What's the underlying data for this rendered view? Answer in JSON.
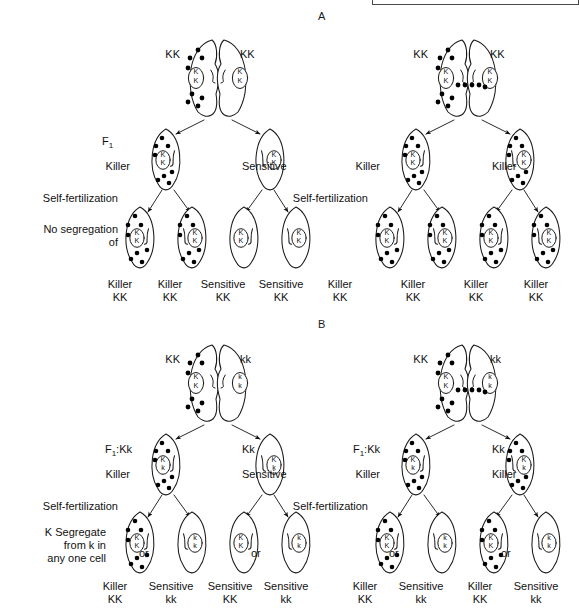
{
  "figure": {
    "title_letters": {
      "panel_a": "A",
      "panel_b": "B"
    },
    "colors": {
      "ink": "#111111",
      "cell_stroke": "#1a1a1a",
      "kappa": "#000000",
      "crop_border": "#4a4a4a"
    }
  },
  "panels": [
    {
      "id": "A",
      "letter": "A",
      "side_labels": [
        {
          "name": "f1",
          "text": "F",
          "sub": "1"
        },
        {
          "name": "killer",
          "text": "Killer"
        },
        {
          "name": "self-fertilization",
          "text": "Self-fertilization"
        },
        {
          "name": "no-segregation-1",
          "text": "No segregation"
        },
        {
          "name": "no-segregation-2",
          "text": "of"
        }
      ],
      "crosses": [
        {
          "id": "A-left",
          "parents": [
            {
              "genotype": "KK",
              "kappa": true,
              "nucleus": "KK"
            },
            {
              "genotype": "KK",
              "kappa": false,
              "nucleus": "KK"
            }
          ],
          "bridge_transfer": false,
          "f1": [
            {
              "phenotype": "Killer",
              "genotype_label": "",
              "kappa": true,
              "nucleus": "KK"
            },
            {
              "phenotype": "Sensitive",
              "genotype_label": "",
              "kappa": false,
              "nucleus": "KK"
            }
          ],
          "offspring": [
            {
              "phenotype": "Killer",
              "genotype": "KK",
              "kappa": true,
              "nucleus": "KK"
            },
            {
              "phenotype": "Killer",
              "genotype": "KK",
              "kappa": true,
              "nucleus": "KK"
            },
            {
              "phenotype": "Sensitive",
              "genotype": "KK",
              "kappa": false,
              "nucleus": "KK"
            },
            {
              "phenotype": "Sensitive",
              "genotype": "KK",
              "kappa": false,
              "nucleus": "KK"
            }
          ]
        },
        {
          "id": "A-right",
          "parents": [
            {
              "genotype": "KK",
              "kappa": true,
              "nucleus": "KK"
            },
            {
              "genotype": "KK",
              "kappa": false,
              "nucleus": "KK"
            }
          ],
          "bridge_transfer": true,
          "f1": [
            {
              "phenotype": "Killer",
              "genotype_label": "",
              "kappa": true,
              "nucleus": "KK"
            },
            {
              "phenotype": "Killer",
              "genotype_label": "",
              "kappa": true,
              "nucleus": "KK"
            }
          ],
          "offspring": [
            {
              "phenotype": "Killer",
              "genotype": "KK",
              "kappa": true,
              "nucleus": "KK"
            },
            {
              "phenotype": "Killer",
              "genotype": "KK",
              "kappa": true,
              "nucleus": "KK"
            },
            {
              "phenotype": "Killer",
              "genotype": "KK",
              "kappa": true,
              "nucleus": "KK"
            },
            {
              "phenotype": "Killer",
              "genotype": "KK",
              "kappa": true,
              "nucleus": "KK"
            }
          ]
        }
      ]
    },
    {
      "id": "B",
      "letter": "B",
      "side_labels": [
        {
          "name": "killer",
          "text": "Killer"
        },
        {
          "name": "self-fertilization",
          "text": "Self-fertilization"
        },
        {
          "name": "k-segregate-1",
          "text": "K Segregate"
        },
        {
          "name": "k-segregate-2",
          "text": "from k in"
        },
        {
          "name": "k-segregate-3",
          "text": "any one cell"
        }
      ],
      "crosses": [
        {
          "id": "B-left",
          "parents": [
            {
              "genotype": "KK",
              "kappa": true,
              "nucleus": "KK"
            },
            {
              "genotype": "kk",
              "kappa": false,
              "nucleus": "kk"
            }
          ],
          "bridge_transfer": false,
          "f1": [
            {
              "phenotype": "Killer",
              "genotype_label": "F1:Kk",
              "kappa": true,
              "nucleus": "Kk"
            },
            {
              "phenotype": "Sensitive",
              "genotype_label": "Kk",
              "kappa": false,
              "nucleus": "Kk"
            }
          ],
          "offspring": [
            {
              "phenotype": "Killer",
              "genotype": "KK",
              "kappa": true,
              "nucleus": "KK"
            },
            {
              "phenotype": "Sensitive",
              "genotype": "kk",
              "kappa": false,
              "nucleus": "kk"
            },
            {
              "phenotype": "Sensitive",
              "genotype": "KK",
              "kappa": false,
              "nucleus": "KK"
            },
            {
              "phenotype": "Sensitive",
              "genotype": "kk",
              "kappa": false,
              "nucleus": "kk"
            }
          ],
          "or_labels": [
            "or",
            "or"
          ]
        },
        {
          "id": "B-right",
          "parents": [
            {
              "genotype": "KK",
              "kappa": true,
              "nucleus": "KK"
            },
            {
              "genotype": "kk",
              "kappa": false,
              "nucleus": "kk"
            }
          ],
          "bridge_transfer": true,
          "f1": [
            {
              "phenotype": "Killer",
              "genotype_label": "F1:Kk",
              "kappa": true,
              "nucleus": "Kk"
            },
            {
              "phenotype": "Killer",
              "genotype_label": "Kk",
              "kappa": true,
              "nucleus": "Kk"
            }
          ],
          "offspring": [
            {
              "phenotype": "Killer",
              "genotype": "KK",
              "kappa": true,
              "nucleus": "KK"
            },
            {
              "phenotype": "Sensitive",
              "genotype": "kk",
              "kappa": false,
              "nucleus": "kk"
            },
            {
              "phenotype": "Killer",
              "genotype": "KK",
              "kappa": true,
              "nucleus": "KK"
            },
            {
              "phenotype": "Sensitive",
              "genotype": "kk",
              "kappa": false,
              "nucleus": "kk"
            }
          ],
          "or_labels": [
            "or",
            "or"
          ]
        }
      ]
    }
  ],
  "text": {
    "A": {
      "letter": "A",
      "p_left_kk": "KK",
      "p_right_kk": "KK",
      "f1": "F",
      "f1_sub": "1",
      "killer": "Killer",
      "sensitive": "Sensitive",
      "self_fert": "Self-fertilization",
      "nosegA": "No segregation",
      "nosegB": "of",
      "out1p": "Killer",
      "out1g": "KK",
      "out2p": "Killer",
      "out2g": "KK",
      "out3p": "Sensitive",
      "out3g": "KK",
      "out4p": "Sensitive",
      "out4g": "KK",
      "r_p_left_kk": "KK",
      "r_p_right_kk": "KK",
      "r_f1_left": "Killer",
      "r_f1_right": "Killer",
      "r_self_fert": "Self-fertilization",
      "rout1p": "Killer",
      "rout1g": "KK",
      "rout2p": "Killer",
      "rout2g": "KK",
      "rout3p": "Killer",
      "rout3g": "KK",
      "rout4p": "Killer",
      "rout4g": "KK"
    },
    "B": {
      "letter": "B",
      "p_left_kk": "KK",
      "p_right_kk": "kk",
      "f1_label": "F",
      "f1_sub": "1",
      "f1_geno": ":Kk",
      "f1_right_geno": "Kk",
      "killer": "Killer",
      "sensitive": "Sensitive",
      "self_fert": "Self-fertilization",
      "segA": "K Segregate",
      "segB": "from k in",
      "segC": "any one cell",
      "or": "or",
      "out1p": "Killer",
      "out1g": "KK",
      "out2p": "Sensitive",
      "out2g": "kk",
      "out3p": "Sensitive",
      "out3g": "KK",
      "out4p": "Sensitive",
      "out4g": "kk",
      "r_p_left_kk": "KK",
      "r_p_right_kk": "kk",
      "r_f1_label": "F",
      "r_f1_sub": "1",
      "r_f1_geno": ":Kk",
      "r_f1_right_geno": "Kk",
      "r_f1_left_ph": "Killer",
      "r_f1_right_ph": "Killer",
      "r_self_fert": "Self-fertilization",
      "rout1p": "Killer",
      "rout1g": "KK",
      "rout2p": "Sensitive",
      "rout2g": "kk",
      "rout3p": "Killer",
      "rout3g": "KK",
      "rout4p": "Sensitive",
      "rout4g": "kk"
    }
  }
}
